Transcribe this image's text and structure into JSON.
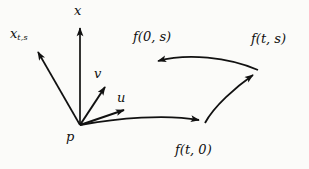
{
  "figure": {
    "type": "vector-diagram",
    "background_color": "#fbfbf9",
    "ink_color": "#111111",
    "width": 309,
    "height": 169
  },
  "labels": {
    "axis_x": "x",
    "axis_xts_base": "x",
    "axis_xts_sub": "t,s",
    "vector_v": "v",
    "vector_u": "u",
    "point_p": "p",
    "curve_f0s": "f(0, s)",
    "curve_fts": "f(t, s)",
    "curve_ft0": "f(t, 0)"
  },
  "points": {
    "p": [
      80,
      125
    ],
    "x_tip": [
      80,
      22
    ],
    "xts_tip": [
      33,
      47
    ],
    "v_tip": [
      110,
      81
    ],
    "u_tip": [
      129,
      107
    ],
    "f0s_tip": [
      151,
      62
    ],
    "fts_tip": [
      258,
      70
    ],
    "ft0_tip": [
      205,
      123
    ]
  },
  "arrows": [
    {
      "name": "x-axis-arrow",
      "from": "p",
      "to": "x_tip",
      "style": "straight"
    },
    {
      "name": "xts-axis-arrow",
      "from": "p",
      "to": "xts_tip",
      "style": "straight"
    },
    {
      "name": "v-vector-arrow",
      "from": "p",
      "to": "v_tip",
      "style": "straight"
    },
    {
      "name": "u-vector-arrow",
      "from": "p",
      "to": "u_tip",
      "style": "straight"
    },
    {
      "name": "ft0-curve",
      "from": "p",
      "to": "ft0_tip",
      "style": "curved"
    },
    {
      "name": "fts-curve",
      "from": "ft0_tip",
      "to": "fts_tip",
      "style": "curved"
    },
    {
      "name": "f0s-curve",
      "from": "fts_tip",
      "to": "f0s_tip",
      "style": "curved"
    }
  ]
}
